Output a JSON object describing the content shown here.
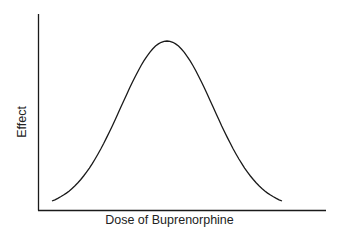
{
  "chart_data": {
    "type": "line",
    "title": "",
    "xlabel": "Dose of Buprenorphine",
    "ylabel": "Effect",
    "x_ticks": [],
    "y_ticks": [],
    "grid": false,
    "legend": null,
    "series": [
      {
        "name": "Effect",
        "x": [
          0,
          0.1,
          0.2,
          0.3,
          0.4,
          0.5,
          0.6,
          0.7,
          0.8,
          0.9,
          1.0
        ],
        "values": [
          0.05,
          0.15,
          0.38,
          0.68,
          0.93,
          1.0,
          0.93,
          0.68,
          0.38,
          0.15,
          0.05
        ]
      }
    ],
    "xlim": [
      0,
      1
    ],
    "ylim": [
      0,
      1.05
    ]
  },
  "colors": {
    "line": "#1a1a1a",
    "axis": "#1a1a1a",
    "text": "#222222"
  }
}
